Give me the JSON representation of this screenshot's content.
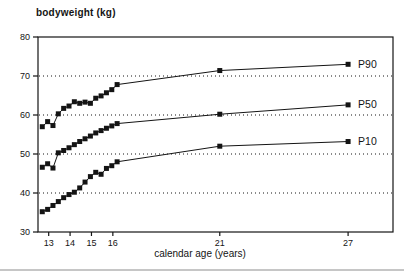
{
  "figure": {
    "title": "bodyweight (kg)",
    "x_axis_title": "calendar age (years)",
    "ink_color": "#141414",
    "page_rule_color": "#c6c6c6",
    "background": "#ffffff"
  },
  "chart_data": {
    "type": "line",
    "title": "bodyweight (kg)",
    "xlabel": "calendar age (years)",
    "ylabel": "bodyweight (kg)",
    "xlim": [
      12.5,
      29.1
    ],
    "ylim": [
      30,
      80
    ],
    "xticks": [
      13,
      14,
      15,
      16,
      21,
      27
    ],
    "yticks": [
      80,
      70,
      60,
      50,
      40,
      30
    ],
    "gridlines_y": [
      70,
      60,
      50,
      40
    ],
    "grid_style": "dotted",
    "legend_position": "inline-right",
    "marker": "filled-square",
    "x": [
      12.7,
      12.95,
      13.2,
      13.45,
      13.7,
      13.95,
      14.2,
      14.45,
      14.7,
      14.95,
      15.2,
      15.45,
      15.7,
      15.95,
      16.2,
      21,
      27
    ],
    "series": [
      {
        "name": "P90",
        "values": [
          57.0,
          58.3,
          57.3,
          60.3,
          61.7,
          62.3,
          63.4,
          63.0,
          63.3,
          63.0,
          64.3,
          64.9,
          65.7,
          66.5,
          67.8,
          71.4,
          73.0
        ]
      },
      {
        "name": "P50",
        "values": [
          46.6,
          47.5,
          46.4,
          50.3,
          50.9,
          51.6,
          52.4,
          53.2,
          53.9,
          54.6,
          55.4,
          56.0,
          56.6,
          57.2,
          57.8,
          60.2,
          62.6
        ]
      },
      {
        "name": "P10",
        "values": [
          35.2,
          35.8,
          36.8,
          37.8,
          38.8,
          39.6,
          40.2,
          41.3,
          42.8,
          44.2,
          45.3,
          44.8,
          46.3,
          47.0,
          48.0,
          52.0,
          53.2
        ]
      }
    ]
  }
}
